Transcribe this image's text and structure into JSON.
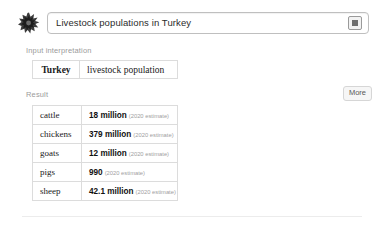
{
  "brand": {
    "logo_icon": "wolfram-spikey-icon"
  },
  "query": {
    "text": "Livestock populations in Turkey",
    "placeholder": "Enter what you want to calculate or know about",
    "keyboard_button_icon": "keyboard-icon"
  },
  "sections": {
    "input_interpretation_label": "Input interpretation",
    "result_label": "Result",
    "more_label": "More"
  },
  "input_interpretation": {
    "subject": "Turkey",
    "property": "livestock population"
  },
  "result": {
    "rows": [
      {
        "animal": "cattle",
        "amount": "18 million",
        "note": "(2020 estimate)"
      },
      {
        "animal": "chickens",
        "amount": "379 million",
        "note": "(2020 estimate)"
      },
      {
        "animal": "goats",
        "amount": "12 million",
        "note": "(2020 estimate)"
      },
      {
        "animal": "pigs",
        "amount": "990",
        "note": "(2020 estimate)"
      },
      {
        "animal": "sheep",
        "amount": "42.1 million",
        "note": "(2020 estimate)"
      }
    ]
  },
  "colors": {
    "page_background": "#ffffff",
    "text_primary": "#1a1a1a",
    "label_gray": "#9b9b9b",
    "note_gray": "#a0a0a0",
    "table_border": "#dcdcdc",
    "input_border": "#bfbfbf"
  }
}
